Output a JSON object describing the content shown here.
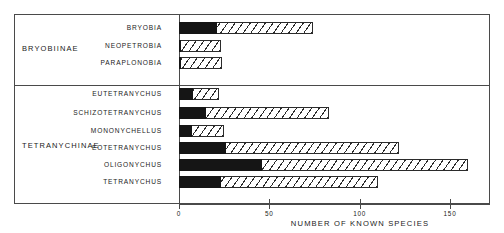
{
  "chart_data": {
    "type": "bar",
    "orientation": "horizontal",
    "title": "",
    "xlabel": "NUMBER OF KNOWN SPECIES",
    "ylabel": "",
    "xlim": [
      0,
      172
    ],
    "xticks": [
      0,
      50,
      100,
      150
    ],
    "xtick_labels": [
      "0",
      "50",
      "100",
      "150"
    ],
    "grid": false,
    "legend": null,
    "groups": [
      {
        "name": "BRYOBIINAE",
        "categories": [
          "BRYOBIA",
          "NEOPETROBIA",
          "PARAPLONOBIA"
        ]
      },
      {
        "name": "TETRANYCHINAE",
        "categories": [
          "EUTETRANYCHUS",
          "SCHIZOTETRANYCHUS",
          "MONONYCHELLUS",
          "EOTETRANYCHUS",
          "OLIGONYCHUS",
          "TETRANYCHUS"
        ]
      }
    ],
    "categories": [
      "BRYOBIA",
      "NEOPETROBIA",
      "PARAPLONOBIA",
      "EUTETRANYCHUS",
      "SCHIZOTETRANYCHUS",
      "MONONYCHELLUS",
      "EOTETRANYCHUS",
      "OLIGONYCHUS",
      "TETRANYCHUS"
    ],
    "series": [
      {
        "name": "solid-segment",
        "style": "solid-black",
        "values": [
          21,
          1,
          1,
          8,
          15,
          7,
          26,
          46,
          23
        ]
      },
      {
        "name": "total",
        "style": "hatched",
        "values": [
          74,
          23,
          24,
          22,
          83,
          25,
          122,
          160,
          110
        ]
      }
    ]
  },
  "rows": [
    {
      "label": "BRYOBIA",
      "solid": 21,
      "total": 74
    },
    {
      "label": "NEOPETROBIA",
      "solid": 1,
      "total": 23
    },
    {
      "label": "PARAPLONOBIA",
      "solid": 1,
      "total": 24
    },
    {
      "label": "EUTETRANYCHUS",
      "solid": 8,
      "total": 22
    },
    {
      "label": "SCHIZOTETRANYCHUS",
      "solid": 15,
      "total": 83
    },
    {
      "label": "MONONYCHELLUS",
      "solid": 7,
      "total": 25
    },
    {
      "label": "EOTETRANYCHUS",
      "solid": 26,
      "total": 122
    },
    {
      "label": "OLIGONYCHUS",
      "solid": 46,
      "total": 160
    },
    {
      "label": "TETRANYCHUS",
      "solid": 23,
      "total": 110
    }
  ],
  "subfamilies": {
    "bryobiinae": "BRYOBIINAE",
    "tetranychinae": "TETRANYCHINAE"
  },
  "axis": {
    "title": "NUMBER OF KNOWN SPECIES",
    "ticks": [
      "0",
      "50",
      "100",
      "150"
    ]
  },
  "colors": {
    "solid_fill": "#151515",
    "hatch_stroke": "#2b2b2b",
    "frame": "#4a4a4a",
    "background": "#ffffff",
    "text": "#1a1a1a"
  }
}
